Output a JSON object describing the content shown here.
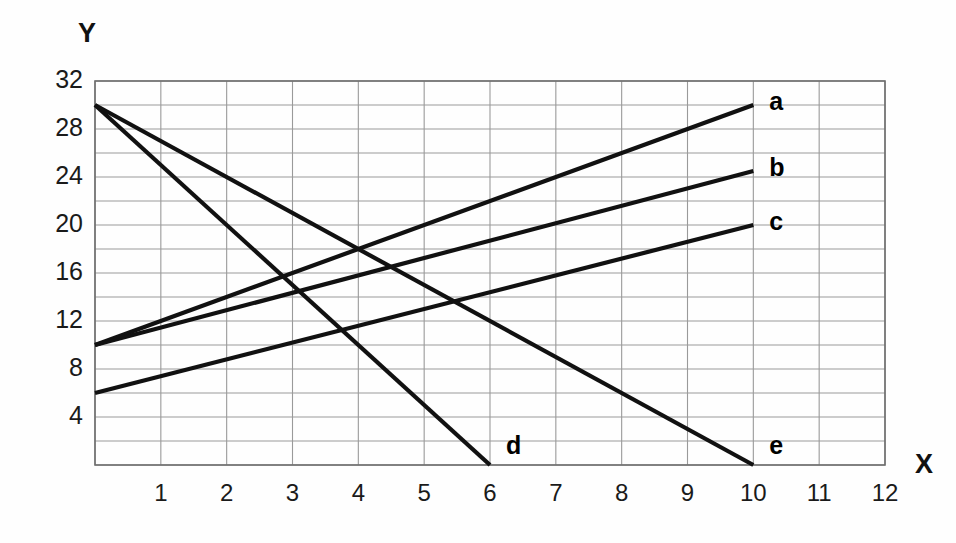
{
  "chart_data": {
    "type": "line",
    "title": "",
    "xlabel": "X",
    "ylabel": "Y",
    "xlim": [
      0,
      12
    ],
    "ylim": [
      0,
      32
    ],
    "grid": true,
    "x_ticks": [
      1,
      2,
      3,
      4,
      5,
      6,
      7,
      8,
      9,
      10,
      11,
      12
    ],
    "y_ticks": [
      4,
      8,
      12,
      16,
      20,
      24,
      28,
      32
    ],
    "x_gridline_step": 1,
    "y_gridline_step": 2,
    "legend_position": "inline-right-end-of-line",
    "line_color": "#111111",
    "grid_color": "#9a9a9a",
    "series": [
      {
        "name": "a",
        "label": "a",
        "x": [
          0,
          10
        ],
        "values": [
          10,
          30
        ],
        "slope": 2.0,
        "intercept": 10
      },
      {
        "name": "b",
        "label": "b",
        "x": [
          0,
          10
        ],
        "values": [
          10,
          24.5
        ],
        "slope": 1.45,
        "intercept": 10
      },
      {
        "name": "c",
        "label": "c",
        "x": [
          0,
          10
        ],
        "values": [
          6,
          20
        ],
        "slope": 1.4,
        "intercept": 6
      },
      {
        "name": "d",
        "label": "d",
        "x": [
          0,
          6
        ],
        "values": [
          30,
          0
        ],
        "slope": -5.0,
        "intercept": 30
      },
      {
        "name": "e",
        "label": "e",
        "x": [
          0,
          10
        ],
        "values": [
          30,
          0
        ],
        "slope": -3.0,
        "intercept": 30
      }
    ],
    "annotations": []
  },
  "axes": {
    "y_axis_title": "Y",
    "x_axis_title": "X",
    "y_tick_labels": [
      "32",
      "28",
      "24",
      "20",
      "16",
      "12",
      "8",
      "4"
    ],
    "x_tick_labels": [
      "1",
      "2",
      "3",
      "4",
      "5",
      "6",
      "7",
      "8",
      "9",
      "10",
      "11",
      "12"
    ]
  },
  "series_labels": {
    "a": "a",
    "b": "b",
    "c": "c",
    "d": "d",
    "e": "e"
  }
}
